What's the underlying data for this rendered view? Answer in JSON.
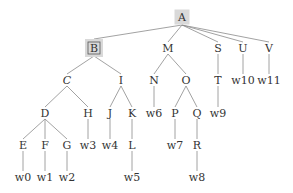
{
  "diagram": {
    "type": "tree",
    "colors": {
      "edge": "#8a8a8a",
      "text": "#333333",
      "highlight": "#d9d9d9"
    },
    "nodes": [
      {
        "id": "A",
        "label": "A",
        "x": 182,
        "y": 17,
        "highlight": "shaded"
      },
      {
        "id": "B",
        "label": "B",
        "x": 94,
        "y": 48,
        "highlight": "shaded-boxed"
      },
      {
        "id": "M",
        "label": "M",
        "x": 168,
        "y": 48
      },
      {
        "id": "S",
        "label": "S",
        "x": 218,
        "y": 48
      },
      {
        "id": "U",
        "label": "U",
        "x": 243,
        "y": 48
      },
      {
        "id": "V",
        "label": "V",
        "x": 269,
        "y": 48
      },
      {
        "id": "C",
        "label": "C",
        "x": 67,
        "y": 80,
        "italic": true
      },
      {
        "id": "I",
        "label": "I",
        "x": 121,
        "y": 80
      },
      {
        "id": "N",
        "label": "N",
        "x": 154,
        "y": 80
      },
      {
        "id": "O",
        "label": "O",
        "x": 186,
        "y": 80
      },
      {
        "id": "T",
        "label": "T",
        "x": 218,
        "y": 80
      },
      {
        "id": "w10",
        "label": "w10",
        "x": 243,
        "y": 80
      },
      {
        "id": "w11",
        "label": "w11",
        "x": 269,
        "y": 80
      },
      {
        "id": "D",
        "label": "D",
        "x": 45,
        "y": 113
      },
      {
        "id": "H",
        "label": "H",
        "x": 88,
        "y": 113
      },
      {
        "id": "J",
        "label": "J",
        "x": 110,
        "y": 113
      },
      {
        "id": "K",
        "label": "K",
        "x": 132,
        "y": 113
      },
      {
        "id": "w6",
        "label": "w6",
        "x": 154,
        "y": 113
      },
      {
        "id": "P",
        "label": "P",
        "x": 175,
        "y": 113
      },
      {
        "id": "Q",
        "label": "Q",
        "x": 197,
        "y": 113
      },
      {
        "id": "w9",
        "label": "w9",
        "x": 218,
        "y": 113
      },
      {
        "id": "E",
        "label": "E",
        "x": 23,
        "y": 145
      },
      {
        "id": "F",
        "label": "F",
        "x": 45,
        "y": 145
      },
      {
        "id": "G",
        "label": "G",
        "x": 67,
        "y": 145
      },
      {
        "id": "w3",
        "label": "w3",
        "x": 88,
        "y": 145
      },
      {
        "id": "w4",
        "label": "w4",
        "x": 110,
        "y": 145
      },
      {
        "id": "L",
        "label": "L",
        "x": 132,
        "y": 145
      },
      {
        "id": "w7",
        "label": "w7",
        "x": 175,
        "y": 145
      },
      {
        "id": "R",
        "label": "R",
        "x": 197,
        "y": 145
      },
      {
        "id": "w0",
        "label": "w0",
        "x": 23,
        "y": 177
      },
      {
        "id": "w1",
        "label": "w1",
        "x": 45,
        "y": 177
      },
      {
        "id": "w2",
        "label": "w2",
        "x": 67,
        "y": 177
      },
      {
        "id": "w5",
        "label": "w5",
        "x": 132,
        "y": 177
      },
      {
        "id": "w8",
        "label": "w8",
        "x": 197,
        "y": 177
      }
    ],
    "edges": [
      [
        "A",
        "B"
      ],
      [
        "A",
        "M"
      ],
      [
        "A",
        "S"
      ],
      [
        "A",
        "U"
      ],
      [
        "A",
        "V"
      ],
      [
        "B",
        "C"
      ],
      [
        "B",
        "I"
      ],
      [
        "M",
        "N"
      ],
      [
        "M",
        "O"
      ],
      [
        "S",
        "T"
      ],
      [
        "U",
        "w10"
      ],
      [
        "V",
        "w11"
      ],
      [
        "C",
        "D"
      ],
      [
        "C",
        "H"
      ],
      [
        "I",
        "J"
      ],
      [
        "I",
        "K"
      ],
      [
        "N",
        "w6"
      ],
      [
        "O",
        "P"
      ],
      [
        "O",
        "Q"
      ],
      [
        "T",
        "w9"
      ],
      [
        "D",
        "E"
      ],
      [
        "D",
        "F"
      ],
      [
        "D",
        "G"
      ],
      [
        "H",
        "w3"
      ],
      [
        "J",
        "w4"
      ],
      [
        "K",
        "L"
      ],
      [
        "P",
        "w7"
      ],
      [
        "Q",
        "R"
      ],
      [
        "E",
        "w0"
      ],
      [
        "F",
        "w1"
      ],
      [
        "G",
        "w2"
      ],
      [
        "L",
        "w5"
      ],
      [
        "R",
        "w8"
      ]
    ]
  }
}
